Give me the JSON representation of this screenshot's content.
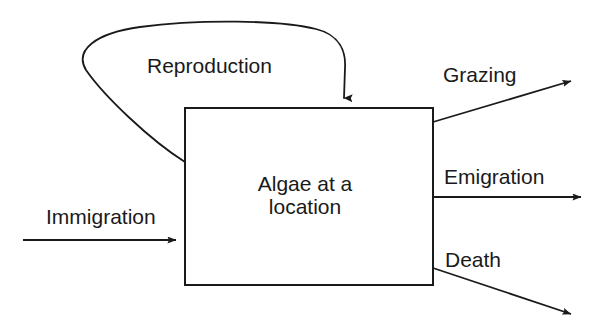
{
  "diagram": {
    "type": "stock-and-flow",
    "background_color": "#ffffff",
    "stroke_color": "#1a1a1a",
    "text_color": "#1a1a1a",
    "stock": {
      "name": "algae-stock",
      "label_line_1": "Algae at a",
      "label_line_2": "location",
      "box": {
        "x": 185,
        "y": 108,
        "width": 248,
        "height": 177
      }
    },
    "flows": [
      {
        "id": "reproduction",
        "label": "Reproduction",
        "direction": "inflow",
        "kind": "feedback-loop",
        "from": "algae-stock-left-edge",
        "to": "algae-stock-top-edge"
      },
      {
        "id": "immigration",
        "label": "Immigration",
        "direction": "inflow",
        "kind": "straight",
        "from": "outside-left",
        "to": "algae-stock-left-edge"
      },
      {
        "id": "grazing",
        "label": "Grazing",
        "direction": "outflow",
        "kind": "straight",
        "from": "algae-stock-right-edge",
        "to": "outside-upper-right"
      },
      {
        "id": "emigration",
        "label": "Emigration",
        "direction": "outflow",
        "kind": "straight",
        "from": "algae-stock-right-edge",
        "to": "outside-right"
      },
      {
        "id": "death",
        "label": "Death",
        "direction": "outflow",
        "kind": "straight",
        "from": "algae-stock-right-edge",
        "to": "outside-lower-right"
      }
    ]
  }
}
